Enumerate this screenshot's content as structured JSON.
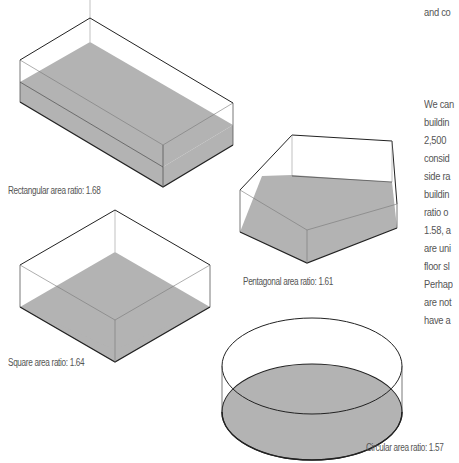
{
  "text_column": {
    "top_fragment": "and co",
    "lines": [
      "We can",
      "buildin",
      "2,500",
      "consid",
      "side ra",
      "buildin",
      "ratio o",
      "1.58, a",
      "are uni",
      "floor sl",
      "Perhap",
      "are not",
      "have a"
    ]
  },
  "figures": [
    {
      "id": "rectangular",
      "caption": "Rectangular area ratio: 1.68"
    },
    {
      "id": "pentagonal",
      "caption": "Pentagonal area ratio: 1.61"
    },
    {
      "id": "square",
      "caption": "Square area ratio: 1.64"
    },
    {
      "id": "circular",
      "caption": "Circular area ratio: 1.57"
    }
  ],
  "colors": {
    "floor_fill": "#b3b3b3",
    "edge": "#222222",
    "hidden_edge": "#888888",
    "caption_text": "#555555"
  }
}
